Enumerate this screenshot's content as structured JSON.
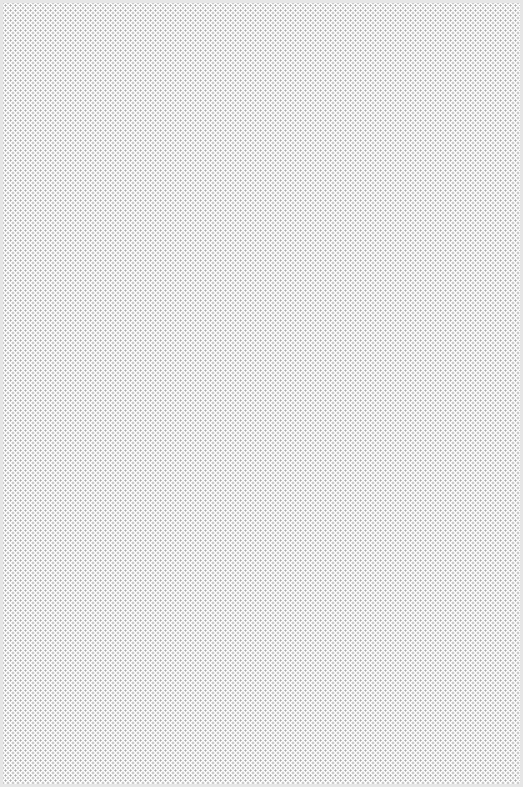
{
  "canvas": {
    "pattern": "dotted-halftone",
    "dot_color": "#a8a8a8",
    "background_color": "#ffffff",
    "border_color": "#e6e6e6"
  }
}
